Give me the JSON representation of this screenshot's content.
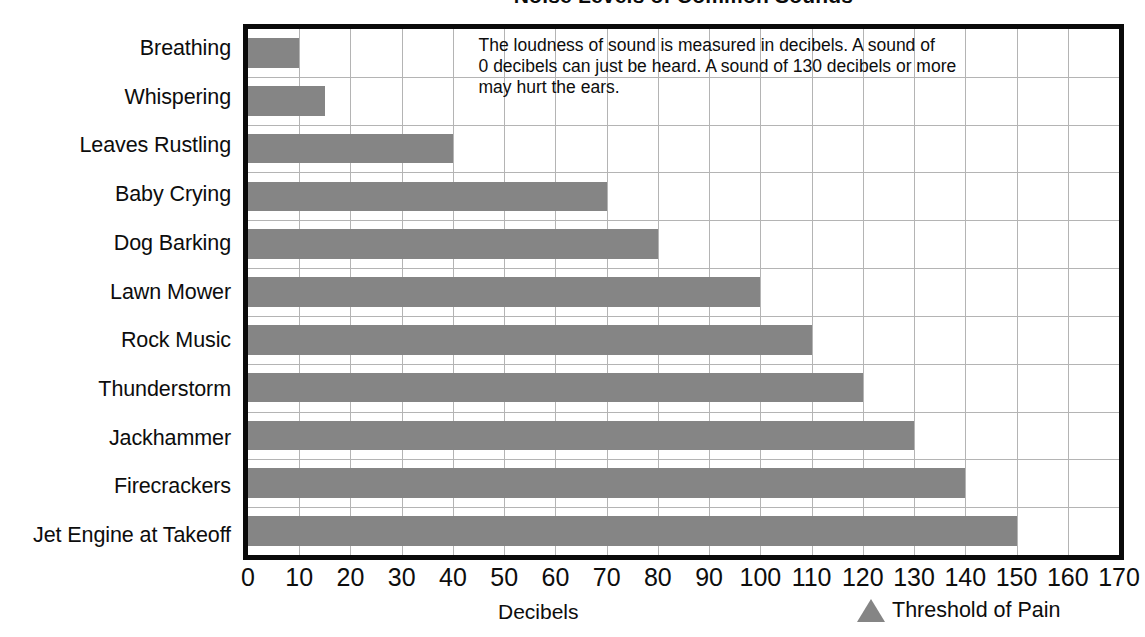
{
  "chart_data": {
    "type": "bar",
    "orientation": "horizontal",
    "title": "Noise Levels of Common Sounds",
    "xlabel": "Decibels",
    "ylabel": "",
    "xlim": [
      0,
      170
    ],
    "xticks": [
      0,
      10,
      20,
      30,
      40,
      50,
      60,
      70,
      80,
      90,
      100,
      110,
      120,
      130,
      140,
      150,
      160,
      170
    ],
    "grid": true,
    "legend_position": "bottom-right",
    "categories": [
      "Breathing",
      "Whispering",
      "Leaves Rustling",
      "Baby Crying",
      "Dog Barking",
      "Lawn Mower",
      "Rock Music",
      "Thunderstorm",
      "Jackhammer",
      "Firecrackers",
      "Jet Engine at Takeoff"
    ],
    "values": [
      10,
      15,
      40,
      70,
      80,
      100,
      110,
      120,
      130,
      140,
      150
    ],
    "series": [
      {
        "name": "Decibels",
        "values": [
          10,
          15,
          40,
          70,
          80,
          100,
          110,
          120,
          130,
          140,
          150
        ]
      }
    ],
    "legend": [
      {
        "label": "Threshold of Pain",
        "marker": "triangle",
        "color": "#858585"
      }
    ],
    "annotations": [
      {
        "name": "info-note",
        "text": "The loudness of sound is measured in decibels. A sound of 0 decibels can just be heard. A sound of 130 decibels or more may hurt the ears.",
        "lines": [
          "The loudness of sound is measured in decibels. A sound of",
          "0 decibels can just be heard. A sound of 130 decibels or more",
          "may hurt the ears."
        ]
      }
    ],
    "colors": {
      "bar": "#858585",
      "grid": "#b4b4b4",
      "axis_border": "#0a0a0a",
      "text": "#0d0d0d",
      "background": "#ffffff"
    }
  }
}
